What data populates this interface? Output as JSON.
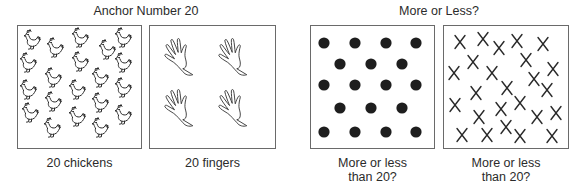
{
  "sections": [
    {
      "title": "Anchor Number 20",
      "panels": [
        {
          "id": "chickens",
          "caption": "20 chickens",
          "item": "chicken-icon",
          "count": 20
        },
        {
          "id": "fingers",
          "caption": "20 fingers",
          "item": "hand-icon",
          "count": 4
        }
      ]
    },
    {
      "title": "More or Less?",
      "panels": [
        {
          "id": "dots",
          "caption_line1": "More or less",
          "caption_line2": "than 20?",
          "item": "dot-icon",
          "count": 18
        },
        {
          "id": "xs",
          "caption_line1": "More or less",
          "caption_line2": "than 20?",
          "item": "x-mark-icon",
          "count": 25
        }
      ]
    }
  ],
  "colors": {
    "ink": "#2a2a2a",
    "border": "#6a6a6a",
    "dot": "#1e1e1e"
  },
  "items": {
    "chickens": [
      [
        32,
        40
      ],
      [
        55,
        48
      ],
      [
        80,
        38
      ],
      [
        107,
        50
      ],
      [
        123,
        38
      ],
      [
        28,
        63
      ],
      [
        80,
        62
      ],
      [
        123,
        63
      ],
      [
        53,
        78
      ],
      [
        100,
        78
      ],
      [
        28,
        90
      ],
      [
        77,
        90
      ],
      [
        123,
        88
      ],
      [
        53,
        102
      ],
      [
        100,
        103
      ],
      [
        30,
        113
      ],
      [
        77,
        117
      ],
      [
        123,
        115
      ],
      [
        52,
        128
      ],
      [
        100,
        128
      ]
    ],
    "hands": [
      [
        184,
        57
      ],
      [
        238,
        57
      ],
      [
        184,
        108
      ],
      [
        238,
        108
      ]
    ],
    "dots": [
      [
        324,
        43
      ],
      [
        355,
        43
      ],
      [
        386,
        43
      ],
      [
        416,
        43
      ],
      [
        340,
        64
      ],
      [
        371,
        64
      ],
      [
        402,
        64
      ],
      [
        324,
        85
      ],
      [
        355,
        85
      ],
      [
        386,
        85
      ],
      [
        416,
        85
      ],
      [
        340,
        108
      ],
      [
        371,
        108
      ],
      [
        402,
        108
      ],
      [
        324,
        132
      ],
      [
        355,
        132
      ],
      [
        386,
        132
      ],
      [
        416,
        132
      ]
    ],
    "xs": [
      [
        460,
        42
      ],
      [
        483,
        39
      ],
      [
        499,
        48
      ],
      [
        517,
        41
      ],
      [
        543,
        44
      ],
      [
        473,
        62
      ],
      [
        526,
        60
      ],
      [
        454,
        73
      ],
      [
        492,
        73
      ],
      [
        553,
        69
      ],
      [
        534,
        79
      ],
      [
        507,
        88
      ],
      [
        547,
        90
      ],
      [
        476,
        93
      ],
      [
        455,
        105
      ],
      [
        520,
        103
      ],
      [
        501,
        109
      ],
      [
        479,
        117
      ],
      [
        537,
        117
      ],
      [
        556,
        113
      ],
      [
        462,
        135
      ],
      [
        487,
        135
      ],
      [
        506,
        127
      ],
      [
        520,
        136
      ],
      [
        552,
        136
      ]
    ]
  }
}
